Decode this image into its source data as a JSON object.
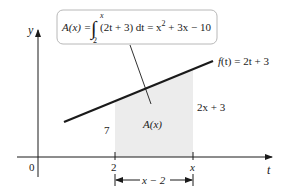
{
  "diagram": {
    "type": "definite-integral-area",
    "axes": {
      "x_label": "t",
      "y_label": "y",
      "origin_label": "0"
    },
    "ticks": {
      "lower_limit": "2",
      "upper_limit": "x"
    },
    "function": {
      "label": "f(t) = 2t + 3",
      "label_parts": {
        "f": "f",
        "arg": "(t)",
        "rhs": " = 2t + 3"
      }
    },
    "formula_box": {
      "lhs": "A(x) = ",
      "integral_upper": "x",
      "integral_lower": "2",
      "integrand": "(2t + 3) dt = x",
      "exponent": "2",
      "rest": " + 3x − 10"
    },
    "region": {
      "label": "A(x)",
      "left_height_label": "7",
      "right_height_label": "2x + 3",
      "width_label": "x − 2"
    },
    "colors": {
      "shade": "#ececec",
      "line": "#1a1a1a",
      "box_border": "#b8b8b8"
    }
  }
}
